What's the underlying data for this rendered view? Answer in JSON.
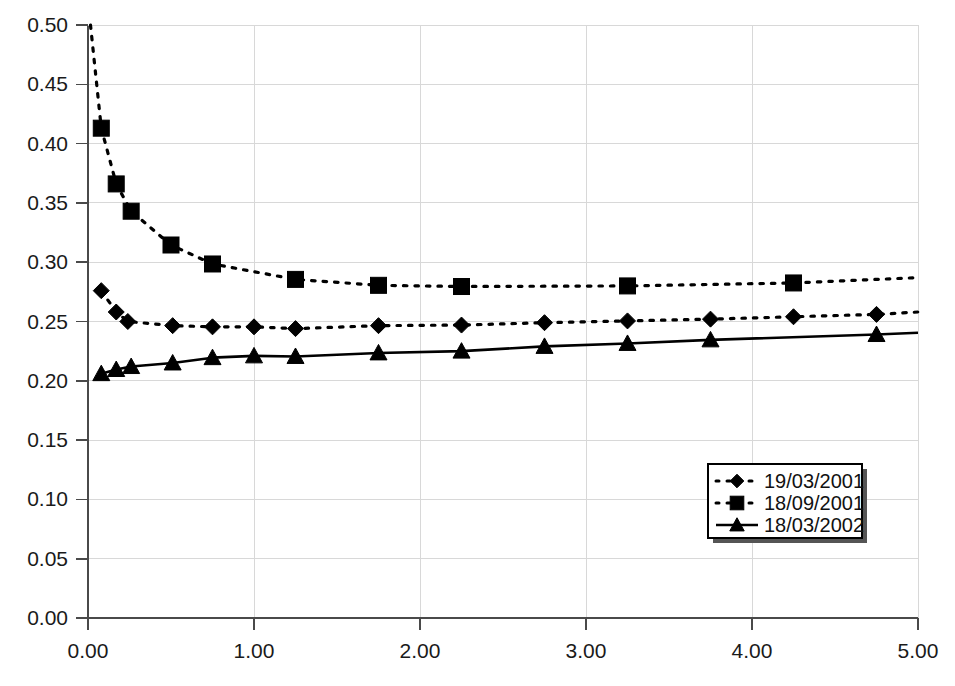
{
  "chart_data": {
    "type": "line",
    "title": "",
    "xlabel": "",
    "ylabel": "",
    "xlim": [
      0.0,
      5.0
    ],
    "ylim": [
      0.0,
      0.5
    ],
    "xticks": [
      0.0,
      1.0,
      2.0,
      3.0,
      4.0,
      5.0
    ],
    "xtick_labels": [
      "0.00",
      "1.00",
      "2.00",
      "3.00",
      "4.00",
      "5.00"
    ],
    "yticks": [
      0.0,
      0.05,
      0.1,
      0.15,
      0.2,
      0.25,
      0.3,
      0.35,
      0.4,
      0.45,
      0.5
    ],
    "ytick_labels": [
      "0.00",
      "0.05",
      "0.10",
      "0.15",
      "0.20",
      "0.25",
      "0.30",
      "0.35",
      "0.40",
      "0.45",
      "0.50"
    ],
    "grid": true,
    "grid_color": "#d8d8d8",
    "legend_position": "lower-right",
    "series": [
      {
        "name": "19/03/2001",
        "marker": "diamond",
        "linestyle": "dotted",
        "color": "#000000",
        "x": [
          0.08,
          0.17,
          0.24,
          0.51,
          0.75,
          1.0,
          1.25,
          1.75,
          2.25,
          2.75,
          3.25,
          3.75,
          4.25,
          4.75
        ],
        "y": [
          0.276,
          0.258,
          0.25,
          0.2465,
          0.2455,
          0.2455,
          0.244,
          0.2465,
          0.247,
          0.249,
          0.2505,
          0.252,
          0.254,
          0.256
        ]
      },
      {
        "name": "18/09/2001",
        "marker": "square",
        "linestyle": "dotted",
        "color": "#000000",
        "x": [
          0.08,
          0.17,
          0.26,
          0.5,
          0.75,
          1.25,
          1.75,
          2.25,
          3.25,
          4.25
        ],
        "y": [
          0.413,
          0.366,
          0.343,
          0.3145,
          0.2985,
          0.2855,
          0.2805,
          0.2795,
          0.28,
          0.2825
        ]
      },
      {
        "name": "18/03/2002",
        "marker": "triangle",
        "linestyle": "solid",
        "color": "#000000",
        "x": [
          0.08,
          0.17,
          0.26,
          0.51,
          0.75,
          1.0,
          1.25,
          1.75,
          2.25,
          2.75,
          3.25,
          3.75,
          4.75
        ],
        "y": [
          0.206,
          0.2095,
          0.212,
          0.215,
          0.2195,
          0.221,
          0.2205,
          0.2235,
          0.225,
          0.229,
          0.2315,
          0.2345,
          0.239
        ]
      }
    ],
    "series_endpoints": {
      "19/03/2001": {
        "x_end": 5.0,
        "y_end": 0.258
      },
      "18/09/2001": {
        "x_end": 5.0,
        "y_end": 0.287
      },
      "18/03/2002": {
        "x_end": 5.0,
        "y_end": 0.2405
      }
    },
    "series_origin": {
      "18/09/2001": {
        "x_start": 0.015,
        "y_start": 0.5
      }
    }
  },
  "legend": {
    "entries": [
      {
        "label": "19/03/2001",
        "marker": "diamond",
        "linestyle": "dotted"
      },
      {
        "label": "18/09/2001",
        "marker": "square",
        "linestyle": "dotted"
      },
      {
        "label": "18/03/2002",
        "marker": "triangle",
        "linestyle": "solid"
      }
    ]
  }
}
